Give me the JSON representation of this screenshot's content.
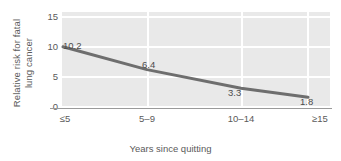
{
  "chart_data": {
    "type": "line",
    "title": "",
    "subtitle": "",
    "xlabel": "Years since quitting",
    "ylabel": "Relative risk for fatal lung cancer",
    "ylabel_lines": [
      "Relative risk for fatal",
      "lung cancer"
    ],
    "categories": [
      "≤5",
      "5–9",
      "10–14",
      "≥15"
    ],
    "values": [
      10.2,
      6.4,
      3.3,
      1.8
    ],
    "point_labels": [
      "10.2",
      "6.4",
      "3.3",
      "1.8"
    ],
    "yticks": [
      "15",
      "10",
      "5",
      "0"
    ],
    "ytick_values": [
      15,
      10,
      5,
      0
    ],
    "ylim": [
      0,
      16
    ],
    "xlim_categories": 4,
    "grid": "horizontal-and-vertical",
    "grid_color": "#ffffff",
    "plot_background": "#e9e9e9",
    "line_color": "#6e6e6e",
    "line_width": 3,
    "legend": "none",
    "legend_position": "none",
    "text_color": "#5a5a5a",
    "axis_color": "#9a9a9a"
  }
}
